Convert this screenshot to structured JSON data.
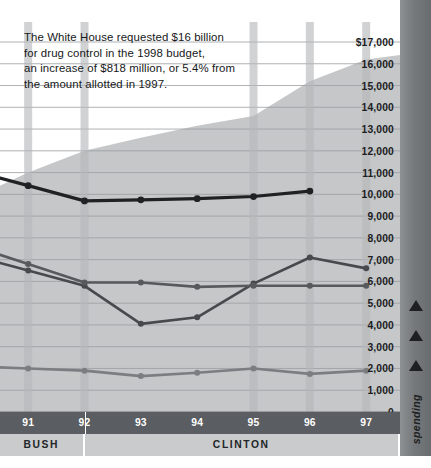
{
  "caption": {
    "line1": "The White House requested $16 billion",
    "line2": "for drug control in the 1998 budget,",
    "line3": "an increase of $818 million, or 5.4% from",
    "line4": "the amount allotted in 1997."
  },
  "rail": {
    "label": "spending",
    "arrow_icon": "up-arrow-icon",
    "arrow_count": 3
  },
  "presidents": [
    {
      "name": "BUSH",
      "start": 90.5,
      "end": 92.0
    },
    {
      "name": "CLINTON",
      "start": 92.0,
      "end": 97.6
    }
  ],
  "colors": {
    "area_fill": "#c5c7c9",
    "band": "#b4b7b9",
    "series_total": "#1f2123",
    "series_treatment": "#47494c",
    "series_enforcement": "#57595c",
    "series_prevention": "#7b7e81",
    "axis_bar": "#5a5d61",
    "president_bar": "#c9cbcd",
    "rail": "#76797c",
    "gridline": "#9a9da0"
  },
  "chart_data": {
    "type": "area",
    "title": "",
    "subtitle": "",
    "xlabel": "",
    "ylabel": "spending",
    "ylim": [
      0,
      17000
    ],
    "xlim": [
      90.5,
      97.6
    ],
    "grid": true,
    "legend": "none",
    "yticks": [
      {
        "value": 17000,
        "label": "$17,000"
      },
      {
        "value": 16000,
        "label": "16,000"
      },
      {
        "value": 15000,
        "label": "15,000"
      },
      {
        "value": 14000,
        "label": "14,000"
      },
      {
        "value": 13000,
        "label": "13,000"
      },
      {
        "value": 12000,
        "label": "12,000"
      },
      {
        "value": 11000,
        "label": "11,000"
      },
      {
        "value": 10000,
        "label": "10,000"
      },
      {
        "value": 9000,
        "label": "9,000"
      },
      {
        "value": 8000,
        "label": "8,000"
      },
      {
        "value": 7000,
        "label": "7,000"
      },
      {
        "value": 6000,
        "label": "6,000"
      },
      {
        "value": 5000,
        "label": "5,000"
      },
      {
        "value": 4000,
        "label": "4,000"
      },
      {
        "value": 3000,
        "label": "3,000"
      },
      {
        "value": 2000,
        "label": "2,000"
      },
      {
        "value": 1000,
        "label": "1,000"
      },
      {
        "value": 0,
        "label": "0"
      }
    ],
    "categories": [
      "91",
      "92",
      "93",
      "94",
      "95",
      "96",
      "97"
    ],
    "x": [
      91,
      92,
      93,
      94,
      95,
      96,
      97
    ],
    "bands_at": [
      91,
      92,
      95,
      96,
      97
    ],
    "area": {
      "name": "Total drug control budget",
      "x": [
        90.5,
        91,
        92,
        93,
        94,
        95,
        96,
        97,
        97.6
      ],
      "values": [
        10400,
        11000,
        12000,
        12600,
        13150,
        13600,
        15200,
        16200,
        16400
      ]
    },
    "series": [
      {
        "name": "Total",
        "values": [
          10400,
          9700,
          9750,
          9800,
          9900,
          10150,
          null
        ],
        "color": "#1f2123"
      },
      {
        "name": "Enforcement",
        "values": [
          6500,
          5800,
          4050,
          4350,
          5900,
          7100,
          6600
        ],
        "color": "#47494c"
      },
      {
        "name": "Treatment",
        "values": [
          6800,
          5950,
          5950,
          5750,
          5800,
          5800,
          5800
        ],
        "color": "#57595c"
      },
      {
        "name": "Prevention",
        "values": [
          2000,
          1900,
          1650,
          1800,
          2000,
          1750,
          1900
        ],
        "color": "#7b7e81"
      }
    ]
  }
}
